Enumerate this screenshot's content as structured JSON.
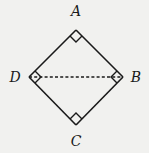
{
  "diagram": {
    "type": "geometry",
    "background": "#f1f1ef",
    "stroke_color": "#1a1a1a",
    "vertices": [
      {
        "name": "A",
        "x": 76,
        "y": 30,
        "label_x": 76,
        "label_y": 16
      },
      {
        "name": "B",
        "x": 123,
        "y": 77,
        "label_x": 136,
        "label_y": 82
      },
      {
        "name": "C",
        "x": 76,
        "y": 125,
        "label_x": 76,
        "label_y": 145
      },
      {
        "name": "D",
        "x": 29,
        "y": 77,
        "label_x": 15,
        "label_y": 82
      }
    ],
    "edges": [
      {
        "from": "A",
        "to": "B",
        "style": "solid"
      },
      {
        "from": "B",
        "to": "C",
        "style": "solid"
      },
      {
        "from": "C",
        "to": "D",
        "style": "solid"
      },
      {
        "from": "D",
        "to": "A",
        "style": "solid"
      },
      {
        "from": "D",
        "to": "B",
        "style": "dashed"
      }
    ],
    "right_angle_marks": [
      "A",
      "B",
      "C",
      "D"
    ],
    "labels": {
      "A": "A",
      "B": "B",
      "C": "C",
      "D": "D"
    }
  }
}
